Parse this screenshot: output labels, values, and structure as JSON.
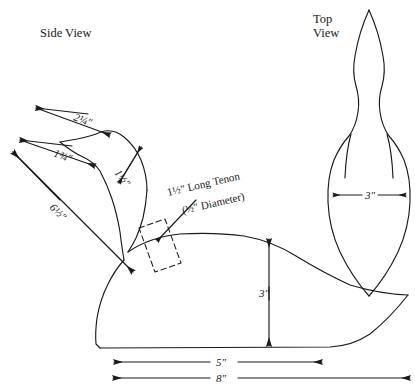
{
  "drawing": {
    "title_side": "Side View",
    "title_top": "Top View",
    "subject": "duck-decoy-pattern",
    "line_color": "#1a1a1a",
    "background_color": "#ffffff"
  },
  "side_view": {
    "label": "Side View",
    "dimensions": [
      {
        "id": "bill-length",
        "text": "2¼″"
      },
      {
        "id": "bill-to-head",
        "text": "1¾″"
      },
      {
        "id": "head-height",
        "text": "1½″"
      },
      {
        "id": "head-overall",
        "text": "6½″"
      },
      {
        "id": "body-height",
        "text": "3″"
      },
      {
        "id": "body-length",
        "text": "5″"
      },
      {
        "id": "overall-length",
        "text": "8″"
      }
    ],
    "tenon_callout": {
      "line1": "1½″ Long Tenon",
      "line2": "(½″ Diameter)"
    }
  },
  "top_view": {
    "label_line1": "Top",
    "label_line2": "View",
    "dimensions": [
      {
        "id": "body-width",
        "text": "3″"
      }
    ]
  }
}
